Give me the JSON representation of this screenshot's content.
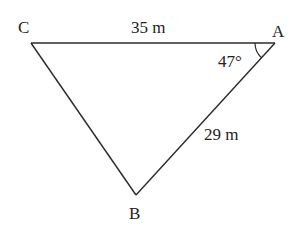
{
  "diagram": {
    "type": "triangle",
    "vertices": {
      "C": {
        "label": "C",
        "x": 31,
        "y": 43
      },
      "A": {
        "label": "A",
        "x": 275,
        "y": 43
      },
      "B": {
        "label": "B",
        "x": 136,
        "y": 195
      }
    },
    "sides": {
      "CA": {
        "label": "35 m"
      },
      "AB": {
        "label": "29 m"
      }
    },
    "angles": {
      "A": {
        "label": "47°"
      }
    },
    "colors": {
      "stroke": "#2a2a2a",
      "text": "#222222",
      "background": "#ffffff"
    }
  }
}
